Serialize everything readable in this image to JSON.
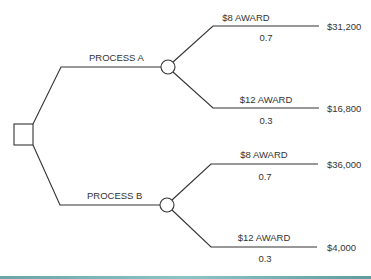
{
  "diagram": {
    "type": "decision-tree",
    "decision_node": {
      "shape": "square"
    },
    "branches": [
      {
        "label": "PROCESS A",
        "outcomes": [
          {
            "label": "$8 AWARD",
            "probability": "0.7",
            "payoff": "$31,200"
          },
          {
            "label": "$12 AWARD",
            "probability": "0.3",
            "payoff": "$16,800"
          }
        ]
      },
      {
        "label": "PROCESS B",
        "outcomes": [
          {
            "label": "$8 AWARD",
            "probability": "0.7",
            "payoff": "$36,000"
          },
          {
            "label": "$12 AWARD",
            "probability": "0.3",
            "payoff": "$4,000"
          }
        ]
      }
    ],
    "colors": {
      "line": "#333333",
      "bottom_band": "#7ab8b8"
    }
  }
}
